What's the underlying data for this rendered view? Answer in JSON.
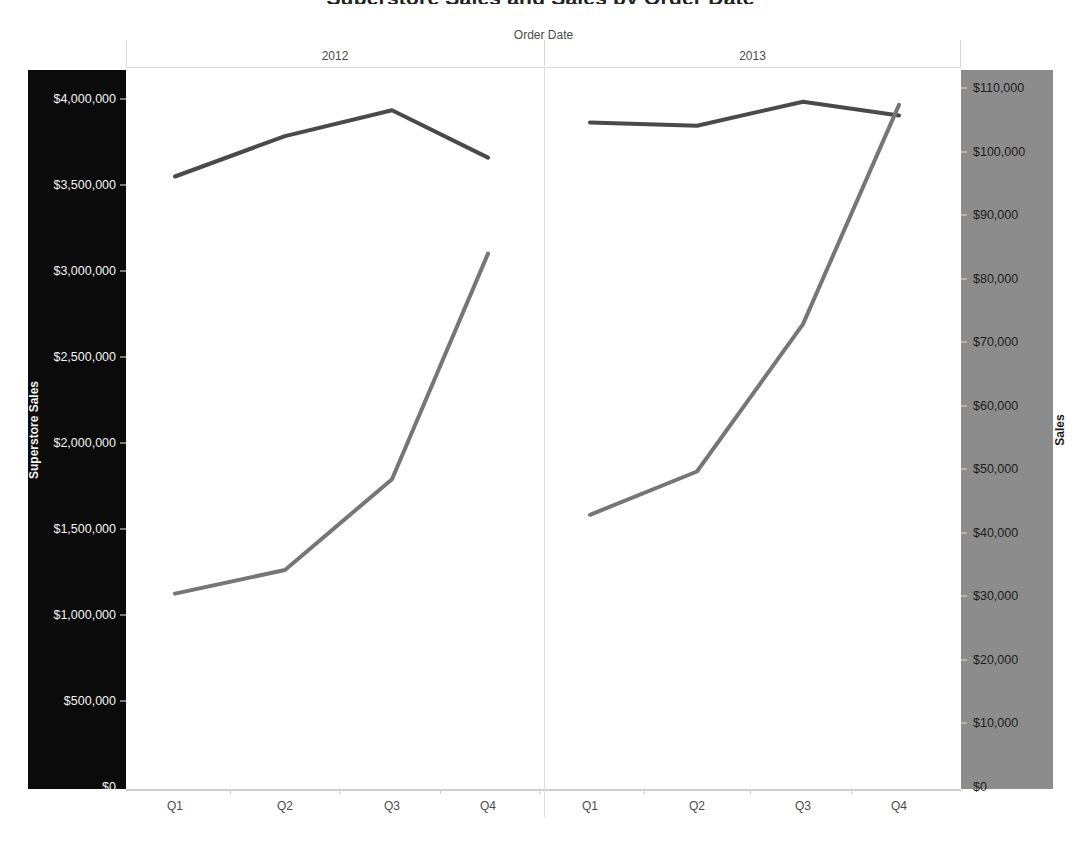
{
  "title": "Superstore Sales and Sales by Order Date",
  "x_field_label": "Order Date",
  "panels": [
    {
      "label": "2012"
    },
    {
      "label": "2013"
    }
  ],
  "left_axis": {
    "title": "Superstore Sales",
    "background_color": "#0b0b0b",
    "text_color": "#f2f2f2",
    "ticks": [
      "$0",
      "$500,000",
      "$1,000,000",
      "$1,500,000",
      "$2,000,000",
      "$2,500,000",
      "$3,000,000",
      "$3,500,000",
      "$4,000,000"
    ],
    "tick_values": [
      0,
      500000,
      1000000,
      1500000,
      2000000,
      2500000,
      3000000,
      3500000,
      4000000
    ],
    "min": 0,
    "max": 4000000
  },
  "right_axis": {
    "title": "Sales",
    "background_color": "#8c8c8c",
    "text_color": "#1c1c1c",
    "ticks": [
      "$0",
      "$10,000",
      "$20,000",
      "$30,000",
      "$40,000",
      "$50,000",
      "$60,000",
      "$70,000",
      "$80,000",
      "$90,000",
      "$100,000",
      "$110,000"
    ],
    "tick_values": [
      0,
      10000,
      20000,
      30000,
      40000,
      50000,
      60000,
      70000,
      80000,
      90000,
      100000,
      110000
    ],
    "min": 0,
    "max": 110000
  },
  "x_axis": {
    "categories": [
      "Q1",
      "Q2",
      "Q3",
      "Q4",
      "Q1",
      "Q2",
      "Q3",
      "Q4"
    ]
  },
  "colors": {
    "superstore_sales_line": "#4a4a4a",
    "sales_line": "#767676",
    "plot_background": "#ffffff",
    "gridline": "#dddddd"
  },
  "chart_data": {
    "type": "line",
    "title": "Superstore Sales and Sales by Order Date",
    "xlabel": "Order Date",
    "grid": false,
    "legend": "none",
    "categories": [
      "2012 Q1",
      "2012 Q2",
      "2012 Q3",
      "2012 Q4",
      "2013 Q1",
      "2013 Q2",
      "2013 Q3",
      "2013 Q4"
    ],
    "panels": [
      "2012",
      "2013"
    ],
    "series": [
      {
        "name": "Superstore Sales",
        "axis": "left",
        "ylabel": "Superstore Sales",
        "ylim": [
          0,
          4000000
        ],
        "color": "#4a4a4a",
        "values": [
          3555000,
          3790000,
          3940000,
          3665000,
          3870000,
          3850000,
          3990000,
          3910000
        ]
      },
      {
        "name": "Sales",
        "axis": "right",
        "ylabel": "Sales",
        "ylim": [
          0,
          110000
        ],
        "color": "#767676",
        "values": [
          30600,
          34300,
          48600,
          84100,
          43000,
          49800,
          73000,
          107500
        ]
      }
    ]
  }
}
